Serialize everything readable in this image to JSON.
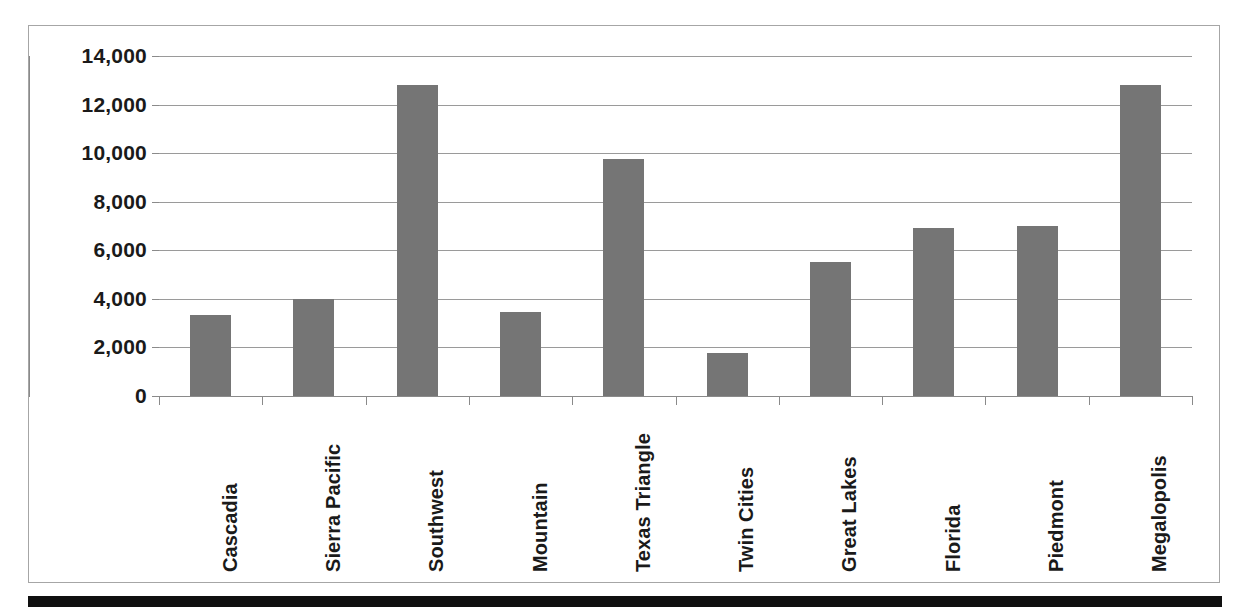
{
  "chart_data": {
    "type": "bar",
    "title": "",
    "xlabel": "",
    "ylabel": "",
    "ylim": [
      0,
      14000
    ],
    "ytick_step": 2000,
    "grid": true,
    "legend": false,
    "bar_color": "#757575",
    "gridline_color": "#9a9a9a",
    "axis_color": "#8a8a8a",
    "frame_color": "#a6a6a6",
    "categories": [
      "Cascadia",
      "Sierra Pacific",
      "Southwest",
      "Mountain",
      "Texas Triangle",
      "Twin Cities",
      "Great Lakes",
      "Florida",
      "Piedmont",
      "Megalopolis"
    ],
    "values": [
      3350,
      3980,
      12800,
      3480,
      9750,
      1770,
      5500,
      6900,
      7010,
      12800
    ],
    "ytick_labels": [
      "0",
      "2,000",
      "4,000",
      "6,000",
      "8,000",
      "10,000",
      "12,000",
      "14,000"
    ],
    "ytick_values": [
      0,
      2000,
      4000,
      6000,
      8000,
      10000,
      12000,
      14000
    ]
  }
}
